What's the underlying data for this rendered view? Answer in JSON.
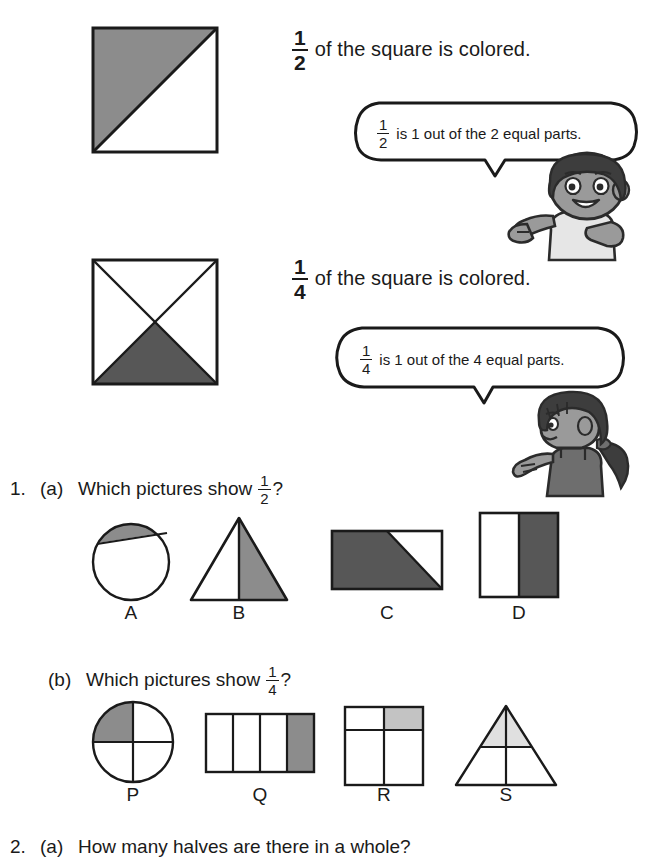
{
  "colors": {
    "ink": "#1a1a1a",
    "shade_medium": "#8c8c8c",
    "shade_dark": "#575757",
    "shade_light": "#c3c3c3",
    "skin": "#9a9a9a",
    "hair": "#3d3d3d",
    "shirt": "#e6e6e6"
  },
  "examples": [
    {
      "fraction": {
        "numerator": "1",
        "denominator": "2"
      },
      "statement": "of the square is colored.",
      "bubble": {
        "fraction": {
          "numerator": "1",
          "denominator": "2"
        },
        "text": "is 1 out of the 2 equal parts."
      },
      "character": "boy"
    },
    {
      "fraction": {
        "numerator": "1",
        "denominator": "4"
      },
      "statement": "of the square is colored.",
      "bubble": {
        "fraction": {
          "numerator": "1",
          "denominator": "4"
        },
        "text": "is 1 out of the 4 equal parts."
      },
      "character": "girl"
    }
  ],
  "questions": [
    {
      "number": "1.",
      "parts": [
        {
          "letter": "(a)",
          "prompt_before": "Which pictures show",
          "fraction": {
            "numerator": "1",
            "denominator": "2"
          },
          "prompt_after": "?",
          "options": [
            {
              "label": "A",
              "shape": "circle-small-segment"
            },
            {
              "label": "B",
              "shape": "triangle-half-right"
            },
            {
              "label": "C",
              "shape": "rectangle-trapezoid"
            },
            {
              "label": "D",
              "shape": "square-half-right"
            }
          ]
        },
        {
          "letter": "(b)",
          "prompt_before": "Which pictures show",
          "fraction": {
            "numerator": "1",
            "denominator": "4"
          },
          "prompt_after": "?",
          "options": [
            {
              "label": "P",
              "shape": "circle-quarter"
            },
            {
              "label": "Q",
              "shape": "rectangle-four-strips"
            },
            {
              "label": "R",
              "shape": "square-unequal-parts"
            },
            {
              "label": "S",
              "shape": "triangle-four-parts"
            }
          ]
        }
      ]
    },
    {
      "number": "2.",
      "parts": [
        {
          "letter": "(a)",
          "prompt_before": "How many halves are there in a whole?",
          "fraction": null,
          "prompt_after": "",
          "options": []
        }
      ]
    }
  ]
}
